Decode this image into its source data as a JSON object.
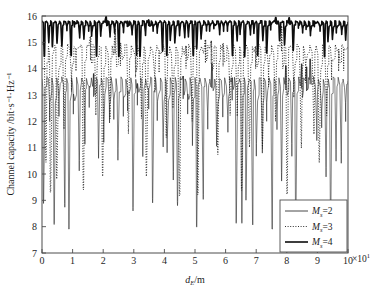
{
  "chart_data": {
    "type": "line",
    "title": "",
    "xlabel": "d_E/m",
    "xlabel_main": "d",
    "xlabel_sub": "E",
    "xlabel_tail": "/m",
    "ylabel": "Channel capacity /bit·s⁻¹·Hz⁻¹",
    "xlim": [
      0,
      10
    ],
    "ylim": [
      7,
      16
    ],
    "x_multiplier_text": "×10",
    "x_multiplier_exp": "1",
    "xticks": [
      0,
      1,
      2,
      3,
      4,
      5,
      6,
      7,
      8,
      9,
      10
    ],
    "xtick_labels": [
      "0",
      "1",
      "2",
      "3",
      "4",
      "5",
      "6",
      "7",
      "8",
      "9",
      "10"
    ],
    "yticks": [
      7,
      8,
      9,
      10,
      11,
      12,
      13,
      14,
      15,
      16
    ],
    "ytick_labels": [
      "7",
      "8",
      "9",
      "10",
      "11",
      "12",
      "13",
      "14",
      "15",
      "16"
    ],
    "grid": false,
    "legend_position": "bottom-right",
    "series": [
      {
        "name": "M_s=2",
        "label_main": "M",
        "label_sub": "s",
        "label_tail": "=2",
        "style": "solid-thin",
        "color": "#1a1a1a",
        "linewidth": 0.55,
        "dash": "none",
        "envelope_top": 13.7,
        "envelope_bottom": 7.9,
        "oscillation_count": 62,
        "description": "Thin solid curve oscillating with deep nulls reaching down to about 8 bit/s/Hz, peaks capped near 13.7 bit/s/Hz"
      },
      {
        "name": "M_s=3",
        "label_main": "M",
        "label_sub": "s",
        "label_tail": "=3",
        "style": "dotted",
        "color": "#1a1a1a",
        "linewidth": 0.9,
        "dash": "1,1.6",
        "envelope_top": 14.95,
        "envelope_bottom": 9.1,
        "oscillation_count": 48,
        "description": "Dotted curve with peaks near 15 bit/s/Hz and nulls around 9.1 bit/s/Hz"
      },
      {
        "name": "M_s=4",
        "label_main": "M",
        "label_sub": "s",
        "label_tail": "=4",
        "style": "solid-thick",
        "color": "#0d0d0d",
        "linewidth": 1.6,
        "dash": "none",
        "envelope_top": 15.82,
        "envelope_bottom": 14.45,
        "oscillation_count": 70,
        "description": "Thick solid curve confined to the top of the plot between roughly 14.5 and 15.85 bit/s/Hz"
      }
    ],
    "axis_color": "#4d4d4d",
    "background_color": "#ffffff"
  },
  "legend": {
    "items": [
      {
        "label_main": "M",
        "label_sub": "s",
        "label_tail": "=2"
      },
      {
        "label_main": "M",
        "label_sub": "s",
        "label_tail": "=3"
      },
      {
        "label_main": "M",
        "label_sub": "s",
        "label_tail": "=4"
      }
    ]
  }
}
